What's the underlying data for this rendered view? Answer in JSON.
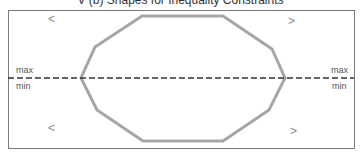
{
  "figure": {
    "title": "V (b) Shapes for Inequality Constraints",
    "colors": {
      "frame": "#7a7a7a",
      "polygon": "#a6a6a6",
      "dashed_line": "#333333",
      "text": "#555555",
      "symbol": "#888888"
    },
    "frame": {
      "x": 8,
      "y": 10,
      "width": 346,
      "height": 138
    },
    "polygon_points": "142,16 223,16 272,49 285,78 269,110 223,141 143,141 97,110 81,78 95,47",
    "divider": {
      "y": 78,
      "x1": 8,
      "x2": 354
    },
    "left_labels": {
      "max": "max",
      "min": "min"
    },
    "right_labels": {
      "max": "max",
      "min": "min"
    },
    "symbols": {
      "top_left": "<",
      "top_right": ">",
      "bottom_left": "<",
      "bottom_right": ">"
    }
  }
}
